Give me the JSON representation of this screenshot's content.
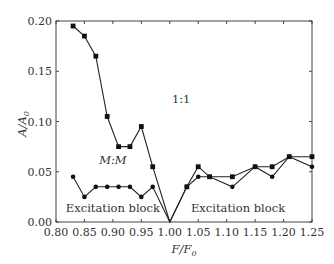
{
  "chart_data": {
    "type": "line",
    "title": "",
    "xlabel": "F/F0",
    "ylabel": "A/A0",
    "xlim": [
      0.8,
      1.25
    ],
    "ylim": [
      0.0,
      0.2
    ],
    "grid": false,
    "legend": "none (inline annotations)",
    "x_ticks": [
      "0.80",
      "0.85",
      "0.90",
      "0.95",
      "1.00",
      "1.05",
      "1.10",
      "1.15",
      "1.20",
      "1.25"
    ],
    "y_ticks": [
      "0.00",
      "0.05",
      "0.10",
      "0.15",
      "0.20"
    ],
    "annotations": [
      {
        "text": "1:1",
        "x": 1.02,
        "y": 0.118
      },
      {
        "text": "M:M",
        "x": 0.9,
        "y": 0.058,
        "italic": true
      },
      {
        "text": "Excitation block",
        "x": 0.9,
        "y": 0.01
      },
      {
        "text": "Excitation block",
        "x": 1.12,
        "y": 0.01
      }
    ],
    "series": [
      {
        "name": "1:1",
        "marker": "square",
        "x": [
          0.83,
          0.85,
          0.87,
          0.89,
          0.91,
          0.93,
          0.95,
          0.97,
          1.0,
          1.03,
          1.05,
          1.07,
          1.11,
          1.15,
          1.18,
          1.21,
          1.25
        ],
        "values": [
          0.195,
          0.185,
          0.165,
          0.105,
          0.075,
          0.075,
          0.095,
          0.055,
          0.0,
          0.035,
          0.055,
          0.045,
          0.045,
          0.055,
          0.055,
          0.065,
          0.065
        ]
      },
      {
        "name": "M:M",
        "marker": "circle",
        "x": [
          0.83,
          0.85,
          0.87,
          0.89,
          0.91,
          0.93,
          0.95,
          0.97,
          1.0,
          1.03,
          1.05,
          1.07,
          1.11,
          1.15,
          1.18,
          1.21,
          1.25
        ],
        "values": [
          0.045,
          0.025,
          0.035,
          0.035,
          0.035,
          0.035,
          0.025,
          0.035,
          0.0,
          0.035,
          0.045,
          0.045,
          0.035,
          0.055,
          0.045,
          0.065,
          0.055
        ]
      }
    ]
  },
  "labels": {
    "ylabel_main": "A/A",
    "ylabel_sub": "0",
    "xlabel_main": "F/F",
    "xlabel_sub": "0"
  }
}
